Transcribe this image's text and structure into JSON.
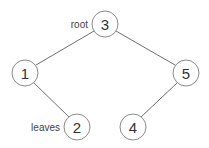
{
  "diagram": {
    "type": "binary-tree",
    "nodes": [
      {
        "id": "n3",
        "value": "3",
        "cx": 105,
        "cy": 24
      },
      {
        "id": "n1",
        "value": "1",
        "cx": 25,
        "cy": 73
      },
      {
        "id": "n5",
        "value": "5",
        "cx": 186,
        "cy": 73
      },
      {
        "id": "n2",
        "value": "2",
        "cx": 77,
        "cy": 127
      },
      {
        "id": "n4",
        "value": "4",
        "cx": 133,
        "cy": 127
      }
    ],
    "edges": [
      {
        "from": "n3",
        "to": "n1"
      },
      {
        "from": "n3",
        "to": "n5"
      },
      {
        "from": "n1",
        "to": "n2"
      },
      {
        "from": "n5",
        "to": "n4"
      }
    ],
    "annotations": {
      "root_label": "root",
      "leaves_label": "leaves"
    },
    "node_radius": 13
  }
}
